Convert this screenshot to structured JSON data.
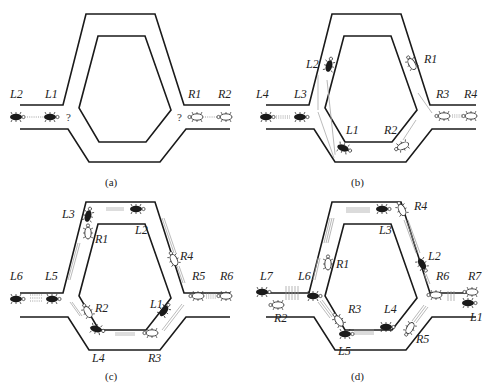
{
  "figure": {
    "panels": [
      {
        "id": "a",
        "caption": "(a)",
        "labels": [
          "L2",
          "L1",
          "R1",
          "R2"
        ],
        "unknown_marks": [
          "?",
          "?"
        ]
      },
      {
        "id": "b",
        "caption": "(b)",
        "labels": [
          "L4",
          "L3",
          "L2",
          "L1",
          "R1",
          "R2",
          "R3",
          "R4"
        ]
      },
      {
        "id": "c",
        "caption": "(c)",
        "labels": [
          "L6",
          "L5",
          "L3",
          "R1",
          "L2",
          "R4",
          "R5",
          "R6",
          "R2",
          "L1",
          "L4",
          "R3"
        ]
      },
      {
        "id": "d",
        "caption": "(d)",
        "labels": [
          "L7",
          "L6",
          "R1",
          "L3",
          "R4",
          "L2",
          "R6",
          "R7",
          "R2",
          "R3",
          "L4",
          "L5",
          "R5",
          "L1"
        ]
      }
    ]
  },
  "text": {
    "a": {
      "cap": "(a)",
      "L2": "L2",
      "L1": "L1",
      "R1": "R1",
      "R2": "R2",
      "q": "?"
    },
    "b": {
      "cap": "(b)",
      "L4": "L4",
      "L3": "L3",
      "L2": "L2",
      "L1": "L1",
      "R1": "R1",
      "R2": "R2",
      "R3": "R3",
      "R4": "R4"
    },
    "c": {
      "cap": "(c)",
      "L6": "L6",
      "L5": "L5",
      "L3": "L3",
      "R1": "R1",
      "L2": "L2",
      "R4": "R4",
      "R5": "R5",
      "R6": "R6",
      "R2": "R2",
      "L1": "L1",
      "L4": "L4",
      "R3": "R3"
    },
    "d": {
      "cap": "(d)",
      "L7": "L7",
      "L6": "L6",
      "R1": "R1",
      "L3": "L3",
      "R4": "R4",
      "L2": "L2",
      "R6": "R6",
      "R7": "R7",
      "R2": "R2",
      "R3": "R3",
      "L4": "L4",
      "L5": "L5",
      "R5": "R5",
      "L1": "L1"
    }
  }
}
